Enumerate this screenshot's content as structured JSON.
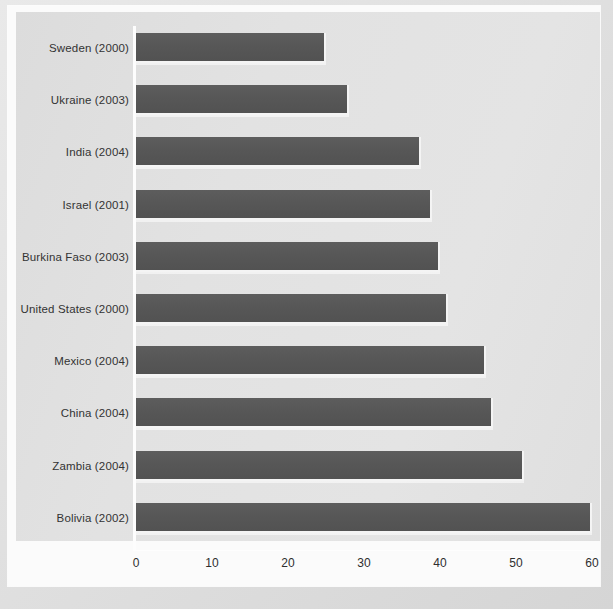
{
  "chart_data": {
    "type": "bar",
    "orientation": "horizontal",
    "title": "",
    "subtitle": "",
    "xlabel": "",
    "ylabel": "",
    "xlim": [
      0,
      60
    ],
    "ylim": null,
    "grid": false,
    "legend": null,
    "legend_position": "none",
    "categories": [
      "Sweden (2000)",
      "Ukraine (2003)",
      "India (2004)",
      "Israel (2001)",
      "Burkina Faso (2003)",
      "United States (2000)",
      "Mexico (2004)",
      "China (2004)",
      "Zambia (2004)",
      "Bolivia (2002)"
    ],
    "values": [
      25,
      28,
      37.5,
      39,
      40,
      41,
      46,
      47,
      51,
      60
    ],
    "xticks": [
      0,
      10,
      20,
      30,
      40,
      50,
      60
    ],
    "xtick_labels": [
      "0",
      "10",
      "20",
      "30",
      "40",
      "50",
      "60"
    ],
    "bars": [
      {
        "label": "Sweden (2000)",
        "value": 25
      },
      {
        "label": "Ukraine (2003)",
        "value": 28
      },
      {
        "label": "India (2004)",
        "value": 37.5
      },
      {
        "label": "Israel (2001)",
        "value": 39
      },
      {
        "label": "Burkina Faso (2003)",
        "value": 40
      },
      {
        "label": "United States (2000)",
        "value": 41
      },
      {
        "label": "Mexico (2004)",
        "value": 46
      },
      {
        "label": "China (2004)",
        "value": 47
      },
      {
        "label": "Zambia (2004)",
        "value": 51
      },
      {
        "label": "Bolivia (2002)",
        "value": 60
      }
    ]
  },
  "colors": {
    "bar_fill": "#575757",
    "bar_highlight": "#f4f4f4",
    "panel_background": "#e2e2e2",
    "paper_background": "#fbfbfb",
    "frame_background": "#dedede",
    "text": "#333333",
    "axis_line": "#fdfdfd"
  }
}
